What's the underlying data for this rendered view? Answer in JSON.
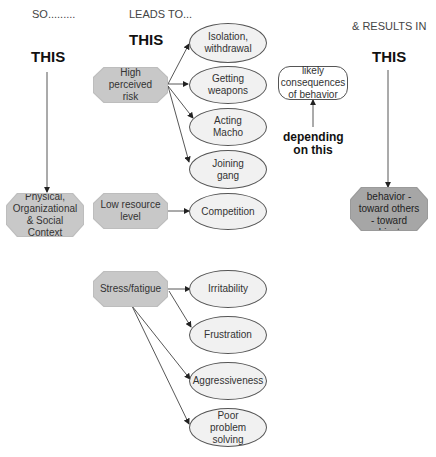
{
  "headers": {
    "so": "SO.........",
    "leads_to": "LEADS TO...",
    "results_in": "& RESULTS IN",
    "this_left": "THIS",
    "this_middle": "THIS",
    "this_right": "THIS"
  },
  "nodes": {
    "context": "Physical, Organizational & Social Context",
    "high_risk": "High perceived risk",
    "low_resource": "Low resource level",
    "stress": "Stress/fatigue",
    "violent": "Violent behavior - toward others - toward objects",
    "isolation": "Isolation, withdrawal",
    "weapons": "Getting weapons",
    "macho": "Acting Macho",
    "gang": "Joining gang",
    "competition": "Competition",
    "irritability": "Irritability",
    "frustration": "Frustration",
    "aggressiveness": "Aggressiveness",
    "problem_solving": "Poor problem solving",
    "consequences": "likely consequences of behavior"
  },
  "annotations": {
    "depending": "depending on this"
  },
  "footer": {
    "faint_text": "Model figure"
  }
}
